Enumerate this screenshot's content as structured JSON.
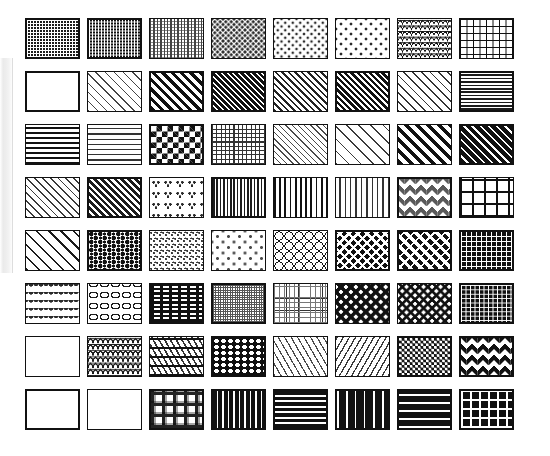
{
  "page": {
    "background": "#ffffff",
    "ink": "#111111",
    "width": 550,
    "height": 456,
    "rows": 8,
    "columns": 8,
    "tile_count": 64,
    "tile_width": 55,
    "tile_height": 41
  },
  "edge_strip": {
    "name": "page-edge-shadow",
    "color": "#e9e9e9"
  },
  "swatches": [
    {
      "id": 1,
      "row": 1,
      "col": 1,
      "name": "dense-weave-dark",
      "label": "Dense dark woven dots",
      "density": "very-high",
      "tone": "#1c1c1c"
    },
    {
      "id": 2,
      "row": 1,
      "col": 2,
      "name": "fine-grid-grey",
      "label": "Fine grey micro grid",
      "density": "high",
      "tone": "#6b6b6b"
    },
    {
      "id": 3,
      "row": 1,
      "col": 3,
      "name": "vertical-bead-light",
      "label": "Light vertical beadwork",
      "density": "medium",
      "tone": "#7a7a7a"
    },
    {
      "id": 4,
      "row": 1,
      "col": 4,
      "name": "scattered-dots-medium",
      "label": "Medium scattered dots",
      "density": "medium",
      "tone": "#3a3a3a"
    },
    {
      "id": 5,
      "row": 1,
      "col": 5,
      "name": "sparse-dots-cross",
      "label": "Sparse cross dots",
      "density": "low",
      "tone": "#3a3a3a"
    },
    {
      "id": 6,
      "row": 1,
      "col": 6,
      "name": "sparse-star-dots",
      "label": "Very sparse star dots",
      "density": "very-low",
      "tone": "#3a3a3a"
    },
    {
      "id": 7,
      "row": 1,
      "col": 7,
      "name": "fish-scale",
      "label": "Fish scale / shell",
      "density": "medium",
      "tone": "#1c1c1c"
    },
    {
      "id": 8,
      "row": 1,
      "col": 8,
      "name": "brick-running-bond",
      "label": "Running bond brick",
      "density": "medium",
      "tone": "#1c1c1c"
    },
    {
      "id": 9,
      "row": 2,
      "col": 1,
      "name": "horizontal-zigzag-fine",
      "label": "Fine horizontal zigzag",
      "density": "high",
      "tone": "#1c1c1c"
    },
    {
      "id": 10,
      "row": 2,
      "col": 2,
      "name": "diagonal-thin-right",
      "label": "Thin right diagonals",
      "density": "low",
      "tone": "#3a3a3a"
    },
    {
      "id": 11,
      "row": 2,
      "col": 3,
      "name": "diagonal-bold-right",
      "label": "Bold right diagonals",
      "density": "high",
      "tone": "#111111"
    },
    {
      "id": 12,
      "row": 2,
      "col": 4,
      "name": "diagonal-dense-right",
      "label": "Dense right diagonals",
      "density": "very-high",
      "tone": "#111111"
    },
    {
      "id": 13,
      "row": 2,
      "col": 5,
      "name": "diagonal-medium-right",
      "label": "Medium right diagonals",
      "density": "medium",
      "tone": "#2a2a2a"
    },
    {
      "id": 14,
      "row": 2,
      "col": 6,
      "name": "diagonal-heavy-right",
      "label": "Heavy right diagonals",
      "density": "high",
      "tone": "#1c1c1c"
    },
    {
      "id": 15,
      "row": 2,
      "col": 7,
      "name": "crosshatch-dash",
      "label": "Dashed crosshatch",
      "density": "medium",
      "tone": "#2a2a2a"
    },
    {
      "id": 16,
      "row": 2,
      "col": 8,
      "name": "horizontal-lines-fine",
      "label": "Fine horizontal lines",
      "density": "high",
      "tone": "#1c1c1c"
    },
    {
      "id": 17,
      "row": 3,
      "col": 1,
      "name": "horizontal-lines-wide",
      "label": "Wide horizontal lines",
      "density": "low",
      "tone": "#111111"
    },
    {
      "id": 18,
      "row": 3,
      "col": 2,
      "name": "dashed-rows",
      "label": "Dashed rows",
      "density": "low",
      "tone": "#3a3a3a"
    },
    {
      "id": 19,
      "row": 3,
      "col": 3,
      "name": "checkerboard-large",
      "label": "Large checkerboard",
      "density": "high",
      "tone": "#111111"
    },
    {
      "id": 20,
      "row": 3,
      "col": 4,
      "name": "grid-fine-square",
      "label": "Fine square grid",
      "density": "medium",
      "tone": "#3a3a3a"
    },
    {
      "id": 21,
      "row": 3,
      "col": 5,
      "name": "diamond-lattice-fine",
      "label": "Fine diamond lattice",
      "density": "medium",
      "tone": "#4a4a4a"
    },
    {
      "id": 22,
      "row": 3,
      "col": 6,
      "name": "diagonal-thin-wide-gap",
      "label": "Thin widely spaced diagonals",
      "density": "very-low",
      "tone": "#3a3a3a"
    },
    {
      "id": 23,
      "row": 3,
      "col": 7,
      "name": "diagonal-bold-wide",
      "label": "Bold wide diagonals",
      "density": "medium",
      "tone": "#111111"
    },
    {
      "id": 24,
      "row": 3,
      "col": 8,
      "name": "diagonal-solid-dark",
      "label": "Solid dark diagonals",
      "density": "very-high",
      "tone": "#111111"
    },
    {
      "id": 25,
      "row": 4,
      "col": 1,
      "name": "diagonal-light-hatch",
      "label": "Light diagonal hatch",
      "density": "low",
      "tone": "#3a3a3a"
    },
    {
      "id": 26,
      "row": 4,
      "col": 2,
      "name": "diagonal-dark-hatch",
      "label": "Dark diagonal hatch",
      "density": "high",
      "tone": "#1c1c1c"
    },
    {
      "id": 27,
      "row": 4,
      "col": 3,
      "name": "clover-motif",
      "label": "Clover / trefoil motif",
      "density": "low",
      "tone": "#2a2a2a"
    },
    {
      "id": 28,
      "row": 4,
      "col": 4,
      "name": "vertical-lines-fine",
      "label": "Fine vertical lines",
      "density": "high",
      "tone": "#1c1c1c"
    },
    {
      "id": 29,
      "row": 4,
      "col": 5,
      "name": "vertical-lines-wide",
      "label": "Wide vertical lines",
      "density": "medium",
      "tone": "#111111"
    },
    {
      "id": 30,
      "row": 4,
      "col": 6,
      "name": "vertical-dotted-columns",
      "label": "Dotted vertical columns",
      "density": "medium",
      "tone": "#3a3a3a"
    },
    {
      "id": 31,
      "row": 4,
      "col": 7,
      "name": "diamond-ornament",
      "label": "Ornamental diamonds",
      "density": "high",
      "tone": "#4a4a4a"
    },
    {
      "id": 32,
      "row": 4,
      "col": 8,
      "name": "grid-large-square",
      "label": "Large square grid",
      "density": "low",
      "tone": "#111111"
    },
    {
      "id": 33,
      "row": 5,
      "col": 1,
      "name": "diamond-net-large",
      "label": "Large diamond net",
      "density": "medium",
      "tone": "#1c1c1c"
    },
    {
      "id": 34,
      "row": 5,
      "col": 2,
      "name": "pebble-mottle",
      "label": "Pebble / mottled blobs",
      "density": "high",
      "tone": "#111111"
    },
    {
      "id": 35,
      "row": 5,
      "col": 3,
      "name": "speckle-fine",
      "label": "Fine speckle",
      "density": "low",
      "tone": "#4a4a4a"
    },
    {
      "id": 36,
      "row": 5,
      "col": 4,
      "name": "dots-sparse-grid",
      "label": "Sparse dot grid",
      "density": "very-low",
      "tone": "#5a5a5a"
    },
    {
      "id": 37,
      "row": 5,
      "col": 5,
      "name": "circles-lattice",
      "label": "Circle lattice",
      "density": "medium",
      "tone": "#111111"
    },
    {
      "id": 38,
      "row": 5,
      "col": 6,
      "name": "basketweave-dark",
      "label": "Dark basketweave",
      "density": "high",
      "tone": "#111111"
    },
    {
      "id": 39,
      "row": 5,
      "col": 7,
      "name": "basketweave-diagonal",
      "label": "Diagonal basketweave",
      "density": "high",
      "tone": "#111111"
    },
    {
      "id": 40,
      "row": 5,
      "col": 8,
      "name": "parquet-weave",
      "label": "Parquet block weave",
      "density": "very-high",
      "tone": "#111111"
    },
    {
      "id": 41,
      "row": 6,
      "col": 1,
      "name": "fan-floral-motif",
      "label": "Fan / floral motif",
      "density": "medium",
      "tone": "#2a2a2a"
    },
    {
      "id": 42,
      "row": 6,
      "col": 2,
      "name": "wave-scallop",
      "label": "Wave scallop",
      "density": "low",
      "tone": "#1c1c1c"
    },
    {
      "id": 43,
      "row": 6,
      "col": 3,
      "name": "square-blocks-bold",
      "label": "Bold square blocks",
      "density": "high",
      "tone": "#111111"
    },
    {
      "id": 44,
      "row": 6,
      "col": 4,
      "name": "mesh-very-fine",
      "label": "Very fine mesh",
      "density": "very-high",
      "tone": "#6b6b6b"
    },
    {
      "id": 45,
      "row": 6,
      "col": 5,
      "name": "grid-dotted-light",
      "label": "Light dotted grid",
      "density": "low",
      "tone": "#5a5a5a"
    },
    {
      "id": 46,
      "row": 6,
      "col": 6,
      "name": "herringbone-large",
      "label": "Large herringbone",
      "density": "medium",
      "tone": "#111111"
    },
    {
      "id": 47,
      "row": 6,
      "col": 7,
      "name": "woven-diagonal-light",
      "label": "Light diagonal weave",
      "density": "medium",
      "tone": "#111111"
    },
    {
      "id": 48,
      "row": 6,
      "col": 8,
      "name": "brick-dark-small",
      "label": "Small dark brick",
      "density": "very-high",
      "tone": "#111111"
    },
    {
      "id": 49,
      "row": 7,
      "col": 1,
      "name": "zigzag-dotted-rows",
      "label": "Dotted zigzag rows",
      "density": "medium",
      "tone": "#3a3a3a"
    },
    {
      "id": 50,
      "row": 7,
      "col": 2,
      "name": "scale-interlock",
      "label": "Interlocking scales",
      "density": "medium",
      "tone": "#1c1c1c"
    },
    {
      "id": 51,
      "row": 7,
      "col": 3,
      "name": "banded-diagonal-rows",
      "label": "Banded diagonal rows",
      "density": "medium",
      "tone": "#111111"
    },
    {
      "id": 52,
      "row": 7,
      "col": 4,
      "name": "dark-dot-rows",
      "label": "Dark dot rows",
      "density": "very-high",
      "tone": "#111111"
    },
    {
      "id": 53,
      "row": 7,
      "col": 5,
      "name": "dash-diagonal-light",
      "label": "Light dashed diagonals",
      "density": "low",
      "tone": "#4a4a4a"
    },
    {
      "id": 54,
      "row": 7,
      "col": 6,
      "name": "dash-diagonal-medium",
      "label": "Medium dashed diagonals",
      "density": "medium",
      "tone": "#3a3a3a"
    },
    {
      "id": 55,
      "row": 7,
      "col": 7,
      "name": "checkerboard-small",
      "label": "Small checkerboard",
      "density": "high",
      "tone": "#111111"
    },
    {
      "id": 56,
      "row": 7,
      "col": 8,
      "name": "diamond-dark-large",
      "label": "Large dark diamonds",
      "density": "high",
      "tone": "#111111"
    },
    {
      "id": 57,
      "row": 8,
      "col": 1,
      "name": "vertical-zigzag-fine",
      "label": "Fine vertical zigzag",
      "density": "high",
      "tone": "#1c1c1c"
    },
    {
      "id": 58,
      "row": 8,
      "col": 2,
      "name": "horizontal-zigzag-wide",
      "label": "Wide horizontal zigzag",
      "density": "medium",
      "tone": "#1c1c1c"
    },
    {
      "id": 59,
      "row": 8,
      "col": 3,
      "name": "plaid-check",
      "label": "Plaid check",
      "density": "high",
      "tone": "#2a2a2a"
    },
    {
      "id": 60,
      "row": 8,
      "col": 4,
      "name": "vertical-bars-bold",
      "label": "Bold vertical bars",
      "density": "very-high",
      "tone": "#111111"
    },
    {
      "id": 61,
      "row": 8,
      "col": 5,
      "name": "horizontal-bars-bold",
      "label": "Bold horizontal bars",
      "density": "very-high",
      "tone": "#111111"
    },
    {
      "id": 62,
      "row": 8,
      "col": 6,
      "name": "vertical-bars-wide-dark",
      "label": "Wide dark vertical bars",
      "density": "very-high",
      "tone": "#111111"
    },
    {
      "id": 63,
      "row": 8,
      "col": 7,
      "name": "horizontal-bars-wide-dark",
      "label": "Wide dark horizontal bars",
      "density": "very-high",
      "tone": "#111111"
    },
    {
      "id": 64,
      "row": 8,
      "col": 8,
      "name": "grid-dark-heavy",
      "label": "Heavy dark grid",
      "density": "very-high",
      "tone": "#111111"
    }
  ]
}
